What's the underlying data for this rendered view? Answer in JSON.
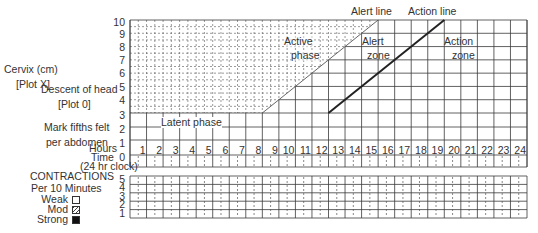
{
  "left_labels": {
    "cervix_line1": "Cervix (cm)",
    "cervix_line2": "[Plot X]",
    "descent_line1": "Descent of head",
    "descent_line2": "[Plot 0]",
    "fifths_line1": "Mark fifths felt",
    "fifths_line2": "per abdomen",
    "hours": "Hours",
    "time": "Time",
    "clock": "(24 hr clock)"
  },
  "contractions": {
    "title": "CONTRACTIONS",
    "subtitle": "Per 10 Minutes",
    "legend": [
      {
        "label": "Weak",
        "pattern": "empty"
      },
      {
        "label": "Mod",
        "pattern": "hatched"
      },
      {
        "label": "Strong",
        "pattern": "solid"
      }
    ],
    "y_ticks": [
      "5",
      "4",
      "3",
      "2",
      "1"
    ]
  },
  "annotations": {
    "alert_line": "Alert line",
    "action_line": "Action line",
    "active_phase_1": "Active",
    "active_phase_2": "phase",
    "alert_zone_1": "Alert",
    "alert_zone_2": "zone",
    "action_zone_1": "Action",
    "action_zone_2": "zone",
    "latent_phase": "Latent phase"
  },
  "chart_data": {
    "type": "line",
    "xlabel": "Hours",
    "ylabel": "Cervix (cm)",
    "x_ticks": [
      "1",
      "2",
      "3",
      "4",
      "5",
      "6",
      "7",
      "8",
      "9",
      "10",
      "11",
      "12",
      "13",
      "14",
      "15",
      "16",
      "17",
      "18",
      "19",
      "20",
      "21",
      "22",
      "23",
      "24"
    ],
    "y_ticks": [
      "10",
      "9",
      "8",
      "7",
      "6",
      "5",
      "4",
      "3",
      "2",
      "1",
      "0"
    ],
    "xlim": [
      0,
      24
    ],
    "ylim": [
      0,
      10
    ],
    "series": [
      {
        "name": "Alert line",
        "x": [
          8,
          15
        ],
        "y": [
          3,
          10
        ]
      },
      {
        "name": "Action line",
        "x": [
          12,
          19
        ],
        "y": [
          3,
          10
        ]
      }
    ],
    "regions": [
      {
        "name": "Latent phase",
        "x": [
          0,
          8
        ],
        "y": [
          0,
          3
        ]
      },
      {
        "name": "Active phase",
        "x": [
          8,
          15
        ],
        "y": [
          3,
          10
        ]
      },
      {
        "name": "Alert zone",
        "x": [
          15,
          19
        ],
        "y": [
          3,
          10
        ]
      },
      {
        "name": "Action zone",
        "x": [
          19,
          24
        ],
        "y": [
          3,
          10
        ]
      }
    ],
    "grid": true,
    "legend_position": "none"
  }
}
